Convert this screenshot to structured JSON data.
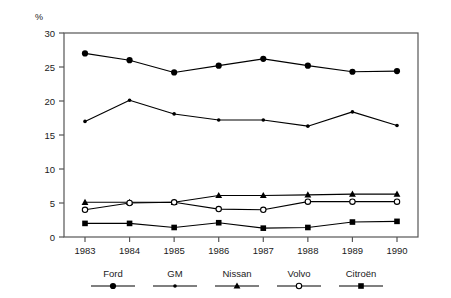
{
  "chart_data": {
    "type": "line",
    "title": "",
    "subtitle": "",
    "xlabel": "",
    "ylabel": "%",
    "categories": [
      "1983",
      "1984",
      "1985",
      "1986",
      "1987",
      "1988",
      "1989",
      "1990"
    ],
    "x": [
      1983,
      1984,
      1985,
      1986,
      1987,
      1988,
      1989,
      1990
    ],
    "ylim": [
      0,
      30
    ],
    "yticks": [
      0,
      5,
      10,
      15,
      20,
      25,
      30
    ],
    "ytick_labels": [
      "0",
      "5",
      "10",
      "15",
      "20",
      "25",
      "30"
    ],
    "grid": false,
    "legend_position": "bottom",
    "series": [
      {
        "name": "Ford",
        "marker": "filled-circle-large",
        "color": "#000000",
        "values": [
          27.0,
          26.0,
          24.2,
          25.2,
          26.2,
          25.2,
          24.3,
          24.4
        ]
      },
      {
        "name": "GM",
        "marker": "filled-circle-small",
        "color": "#000000",
        "values": [
          17.0,
          20.1,
          18.1,
          17.2,
          17.2,
          16.3,
          18.4,
          16.4
        ]
      },
      {
        "name": "Nissan",
        "marker": "filled-triangle",
        "color": "#000000",
        "values": [
          5.1,
          5.1,
          5.1,
          6.1,
          6.1,
          6.2,
          6.3,
          6.3
        ]
      },
      {
        "name": "Volvo",
        "marker": "open-circle",
        "color": "#000000",
        "values": [
          4.0,
          5.0,
          5.1,
          4.1,
          4.0,
          5.2,
          5.2,
          5.2
        ]
      },
      {
        "name": "Citroën",
        "marker": "filled-square",
        "color": "#000000",
        "values": [
          2.0,
          2.0,
          1.4,
          2.1,
          1.3,
          1.4,
          2.2,
          2.3
        ]
      }
    ]
  },
  "axes": {
    "y_unit_label": "%"
  },
  "legend": {
    "entries": [
      {
        "label": "Ford",
        "marker": "filled-circle-large"
      },
      {
        "label": "GM",
        "marker": "filled-circle-small"
      },
      {
        "label": "Nissan",
        "marker": "filled-triangle"
      },
      {
        "label": "Volvo",
        "marker": "open-circle"
      },
      {
        "label": "Citroën",
        "marker": "filled-square"
      }
    ]
  },
  "style": {
    "line_color": "#000000",
    "frame_color": "#555555",
    "text_color": "#1a1a1a",
    "background": "#ffffff"
  }
}
